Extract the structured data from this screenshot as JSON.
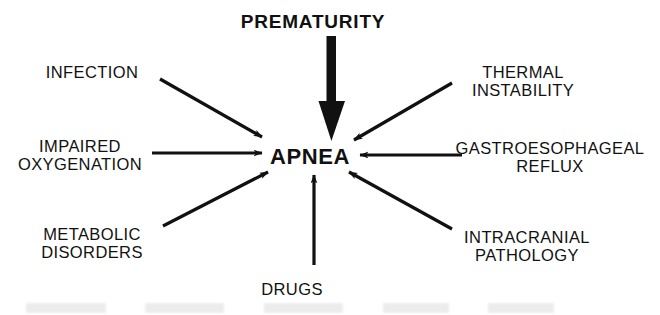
{
  "figure": {
    "type": "radial-cause-diagram",
    "center": {
      "id": "apnea",
      "label": "APNEA"
    },
    "emphasis_node": {
      "id": "prematurity",
      "label": "PREMATURITY",
      "arrow_style": "thick"
    },
    "factors": [
      {
        "id": "prematurity",
        "lines": [
          "PREMATURITY"
        ],
        "position": "top",
        "arrow": "thick-down"
      },
      {
        "id": "infection",
        "lines": [
          "INFECTION"
        ],
        "position": "upper-left",
        "arrow": "diagonal-down-right"
      },
      {
        "id": "thermal-instability",
        "lines": [
          "THERMAL",
          "INSTABILITY"
        ],
        "position": "upper-right",
        "arrow": "diagonal-down-left"
      },
      {
        "id": "impaired-oxygenation",
        "lines": [
          "IMPAIRED",
          "OXYGENATION"
        ],
        "position": "left",
        "arrow": "horizontal-right"
      },
      {
        "id": "gastroesophageal-reflux",
        "lines": [
          "GASTROESOPHAGEAL",
          "REFLUX"
        ],
        "position": "right",
        "arrow": "horizontal-left"
      },
      {
        "id": "metabolic-disorders",
        "lines": [
          "METABOLIC",
          "DISORDERS"
        ],
        "position": "lower-left",
        "arrow": "diagonal-up-right"
      },
      {
        "id": "intracranial-pathology",
        "lines": [
          "INTRACRANIAL",
          "PATHOLOGY"
        ],
        "position": "lower-right",
        "arrow": "diagonal-up-left"
      },
      {
        "id": "drugs",
        "lines": [
          "DRUGS"
        ],
        "position": "bottom",
        "arrow": "vertical-up"
      }
    ],
    "colors": {
      "ink": "#111111",
      "background": "#ffffff"
    }
  },
  "labels": {
    "prematurity": "PREMATURITY",
    "apnea": "APNEA",
    "infection": "INFECTION",
    "thermal_1": "THERMAL",
    "thermal_2": "INSTABILITY",
    "oxygenation_1": "IMPAIRED",
    "oxygenation_2": "OXYGENATION",
    "reflux_1": "GASTROESOPHAGEAL",
    "reflux_2": "REFLUX",
    "metabolic_1": "METABOLIC",
    "metabolic_2": "DISORDERS",
    "intracranial_1": "INTRACRANIAL",
    "intracranial_2": "PATHOLOGY",
    "drugs": "DRUGS"
  }
}
